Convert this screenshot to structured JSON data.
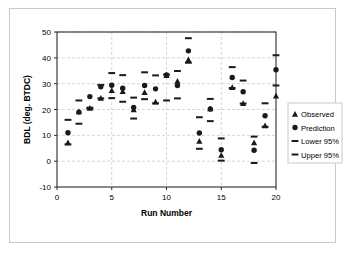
{
  "chart_data": {
    "type": "scatter",
    "title": "",
    "xlabel": "Run Number",
    "ylabel": "BDL (deg. BTDC)",
    "xlim": [
      0,
      20
    ],
    "ylim": [
      -10,
      50
    ],
    "xticks": [
      0,
      5,
      10,
      15,
      20
    ],
    "yticks": [
      -10,
      0,
      10,
      20,
      30,
      40,
      50
    ],
    "xtick_labels": [
      "0",
      "5",
      "10",
      "15",
      "20"
    ],
    "ytick_labels": [
      "-10",
      "0",
      "10",
      "20",
      "30",
      "40",
      "50"
    ],
    "grid": true,
    "legend_position": "right",
    "x": [
      1,
      2,
      3,
      4,
      5,
      6,
      7,
      8,
      9,
      10,
      11,
      12,
      13,
      14,
      15,
      16,
      17,
      18,
      19,
      20
    ],
    "series": [
      {
        "name": "Observed",
        "marker": "triangle",
        "color": "#1a1a1a",
        "values": [
          7.2,
          19.2,
          20.5,
          24.4,
          27.4,
          27.0,
          20.0,
          26.6,
          23.0,
          33.2,
          31.0,
          39.3,
          7.8,
          20.3,
          2.3,
          28.6,
          22.4,
          7.2,
          13.8,
          25.3
        ]
      },
      {
        "name": "Prediction",
        "marker": "circle",
        "color": "#1a1a1a",
        "values": [
          11.0,
          19.0,
          25.0,
          28.8,
          29.4,
          28.2,
          20.8,
          29.3,
          28.0,
          33.4,
          29.3,
          42.7,
          10.9,
          20.2,
          4.4,
          32.4,
          26.9,
          4.2,
          17.6,
          35.4
        ]
      },
      {
        "name": "Lower 95%",
        "marker": "dash",
        "color": "#1a1a1a",
        "values": [
          6.5,
          14.5,
          20.3,
          24.3,
          24.4,
          23.0,
          16.5,
          24.0,
          22.4,
          23.5,
          24.3,
          38.1,
          4.8,
          15.5,
          0.2,
          28.3,
          22.3,
          -0.7,
          13.3,
          29.3
        ]
      },
      {
        "name": "Upper 95%",
        "marker": "dash",
        "color": "#1a1a1a",
        "values": [
          16.0,
          23.5,
          20.7,
          29.5,
          34.1,
          33.3,
          24.6,
          34.4,
          33.2,
          33.5,
          34.9,
          47.6,
          17.0,
          24.1,
          8.8,
          36.4,
          31.2,
          9.5,
          22.4,
          41.0
        ]
      }
    ]
  },
  "legend": {
    "entries": [
      {
        "label": "Observed",
        "marker": "triangle"
      },
      {
        "label": "Prediction",
        "marker": "circle"
      },
      {
        "label": "Lower 95%",
        "marker": "dash"
      },
      {
        "label": "Upper 95%",
        "marker": "dash"
      }
    ]
  },
  "colors": {
    "marker": "#1a1a1a",
    "axis": "#2b2b2b",
    "grid": "#cccccc",
    "frame": "#c9c9c9",
    "background": "#ffffff"
  }
}
